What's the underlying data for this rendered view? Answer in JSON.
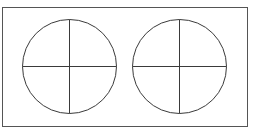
{
  "diagram": {
    "frame": {
      "x": 2.5,
      "y": 7.5,
      "width": 245,
      "height": 119,
      "stroke": "#555555"
    },
    "circles": [
      {
        "name": "left-circle",
        "cx": 69.5,
        "cy": 66.5,
        "r": 47
      },
      {
        "name": "right-circle",
        "cx": 179.5,
        "cy": 66.5,
        "r": 47
      }
    ],
    "stroke_color": "#3a3a3a"
  }
}
